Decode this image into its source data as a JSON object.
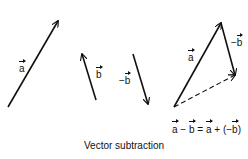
{
  "diagram": {
    "caption": "Vector subtraction",
    "equation": {
      "lhs_a": "a",
      "minus": " − ",
      "lhs_b": "b",
      "equals": " = ",
      "rhs_a": "a",
      "plus_open": " + (−",
      "rhs_b": "b",
      "close": ")"
    },
    "labels": {
      "vector_a": "a",
      "vector_b": "b",
      "neg_b_prefix": "−",
      "vector_neg_b": "b",
      "triangle_a": "a",
      "triangle_neg_b_prefix": "−",
      "triangle_neg_b": "b"
    },
    "vectors": [
      {
        "name": "a",
        "from": [
          8,
          107
        ],
        "to": [
          58,
          21
        ],
        "style": "solid"
      },
      {
        "name": "b",
        "from": [
          96,
          100
        ],
        "to": [
          82,
          54
        ],
        "style": "solid"
      },
      {
        "name": "-b",
        "from": [
          133,
          54
        ],
        "to": [
          148,
          104
        ],
        "style": "solid"
      },
      {
        "name": "triangle-a",
        "from": [
          174,
          107
        ],
        "to": [
          221,
          23
        ],
        "style": "solid"
      },
      {
        "name": "triangle-neg-b",
        "from": [
          221,
          23
        ],
        "to": [
          235,
          75
        ],
        "style": "solid"
      },
      {
        "name": "a-minus-b",
        "from": [
          174,
          107
        ],
        "to": [
          235,
          75
        ],
        "style": "dashed"
      }
    ],
    "colors": {
      "stroke": "#111111",
      "background": "#ffffff"
    }
  }
}
